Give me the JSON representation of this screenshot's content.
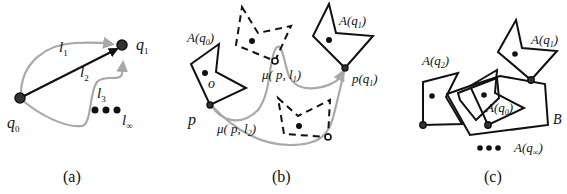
{
  "figure": {
    "panels": [
      {
        "id": "a",
        "caption": "(a)",
        "labels": {
          "q0": "q",
          "q0_sub": "0",
          "q1": "q",
          "q1_sub": "1",
          "l1": "l",
          "l1_sub": "1",
          "l2": "l",
          "l2_sub": "2",
          "l3": "l",
          "l3_sub": "3",
          "linf": "l",
          "linf_sub": "∞"
        }
      },
      {
        "id": "b",
        "caption": "(b)",
        "labels": {
          "A_q0": "A(q",
          "A_q0_sub": "0",
          "A_q0_close": ")",
          "A_q1": "A(q",
          "A_q1_sub": "1",
          "A_q1_close": ")",
          "o": "o",
          "p": "p",
          "mu_l1": "μ( p, l",
          "mu_l1_sub": "1",
          "mu_l1_close": ")",
          "mu_l2": "μ( p, l",
          "mu_l2_sub": "2",
          "mu_l2_close": ")",
          "p_q1": "p(q",
          "p_q1_sub": "1",
          "p_q1_close": ")"
        }
      },
      {
        "id": "c",
        "caption": "(c)",
        "labels": {
          "A_q1": "A(q",
          "A_q1_sub": "1",
          "A_q1_close": ")",
          "A_q2": "A(q",
          "A_q2_sub": "2",
          "A_q2_close": ")",
          "A_q0": "A(q",
          "A_q0_sub": "0",
          "A_q0_close": ")",
          "B": "B",
          "A_qinf": "A(q",
          "A_qinf_sub": "∞",
          "A_qinf_close": ")"
        }
      }
    ],
    "colors": {
      "ink": "#111111",
      "path_gray": "#a9a9a9",
      "background": "#ffffff"
    }
  }
}
